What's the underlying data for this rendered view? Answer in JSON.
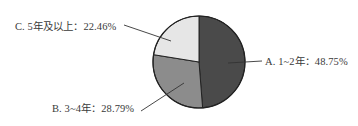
{
  "chart_data": {
    "type": "pie",
    "title": "",
    "categories": [
      "A. 1~2年",
      "B. 3~4年",
      "C. 5年及以上"
    ],
    "values": [
      48.75,
      28.79,
      22.46
    ],
    "unit": "%",
    "start_angle": "12 o'clock",
    "direction": "clockwise",
    "colors": [
      "#4a4a4a",
      "#8c8c8c",
      "#e6e6e6"
    ],
    "labels": [
      {
        "text": "A. 1~2年：48.75%",
        "position": "right"
      },
      {
        "text": "B. 3~4年：28.79%",
        "position": "bottom-left"
      },
      {
        "text": "C. 5年及以上：22.46%",
        "position": "top-left"
      }
    ],
    "legend": "none (leader-line labels)"
  },
  "labels": {
    "a": "A. 1~2年：48.75%",
    "b": "B. 3~4年：28.79%",
    "c": "C. 5年及以上：22.46%"
  }
}
